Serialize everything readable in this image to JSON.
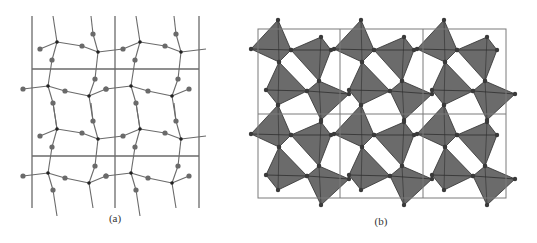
{
  "figure": {
    "panels": [
      {
        "id": "a",
        "caption": "(a)",
        "description": "Framework of linked nodes (T atoms) with bridging atoms, drawn over a 2x2 unit-cell grid",
        "grid": {
          "x_lines": [
            32,
            115,
            199
          ],
          "y_lines": [
            69,
            156
          ],
          "top": 16,
          "bottom": 208
        },
        "cell": {
          "origin": [
            0,
            0
          ],
          "dx": 83,
          "dy": 87,
          "repeat_x": 2,
          "repeat_y": 2
        },
        "nodes": [
          [
            57,
            42
          ],
          [
            98,
            52
          ],
          [
            48,
            86
          ],
          [
            89,
            96
          ]
        ],
        "bridges": [
          [
            40,
            49
          ],
          [
            82,
            46
          ],
          [
            52,
            60
          ],
          [
            93,
            34
          ],
          [
            95,
            79
          ],
          [
            65,
            91
          ],
          [
            23,
            89
          ],
          [
            53,
            103
          ],
          [
            106,
            89
          ]
        ],
        "bonds": [
          [
            [
              40,
              49
            ],
            [
              57,
              42
            ]
          ],
          [
            [
              57,
              42
            ],
            [
              82,
              46
            ]
          ],
          [
            [
              82,
              46
            ],
            [
              98,
              52
            ]
          ],
          [
            [
              57,
              42
            ],
            [
              52,
              60
            ]
          ],
          [
            [
              52,
              60
            ],
            [
              48,
              86
            ]
          ],
          [
            [
              57,
              42
            ],
            [
              53,
              16
            ]
          ],
          [
            [
              98,
              52
            ],
            [
              93,
              34
            ]
          ],
          [
            [
              93,
              34
            ],
            [
              91,
              16
            ]
          ],
          [
            [
              98,
              52
            ],
            [
              123,
              49
            ]
          ],
          [
            [
              98,
              52
            ],
            [
              95,
              79
            ]
          ],
          [
            [
              95,
              79
            ],
            [
              89,
              96
            ]
          ],
          [
            [
              23,
              89
            ],
            [
              48,
              86
            ]
          ],
          [
            [
              48,
              86
            ],
            [
              65,
              91
            ]
          ],
          [
            [
              65,
              91
            ],
            [
              89,
              96
            ]
          ],
          [
            [
              48,
              86
            ],
            [
              53,
              103
            ]
          ],
          [
            [
              53,
              103
            ],
            [
              57,
              129
            ]
          ],
          [
            [
              89,
              96
            ],
            [
              106,
              89
            ]
          ],
          [
            [
              89,
              96
            ],
            [
              93,
              121
            ]
          ]
        ],
        "colors": {
          "line": "#6a6a6a",
          "node": "#222222",
          "bridge": "#6a6a6a"
        }
      },
      {
        "id": "b",
        "caption": "(b)",
        "description": "Polyhedral representation: corner-sharing tetrahedra in a 3x2 unit-cell grid",
        "box": {
          "x": 258,
          "y": 29,
          "width": 248,
          "height": 169
        },
        "dividers": {
          "x": [
            340,
            423
          ],
          "y": [
            114
          ]
        },
        "cell": {
          "origin": [
            258,
            29
          ],
          "dx": 83,
          "dy": 85,
          "repeat_x": 3,
          "repeat_y": 2
        },
        "tetrahedra": [
          [
            [
              20,
              -9
            ],
            [
              -7,
              20
            ],
            [
              21,
              33
            ],
            [
              33,
              21
            ]
          ],
          [
            [
              63,
              8
            ],
            [
              33,
              21
            ],
            [
              61,
              52
            ],
            [
              73,
              21
            ]
          ],
          [
            [
              21,
              33
            ],
            [
              8,
              61
            ],
            [
              20,
              76
            ],
            [
              49,
              62
            ]
          ],
          [
            [
              61,
              52
            ],
            [
              49,
              62
            ],
            [
              63,
              91
            ],
            [
              91,
              65
            ]
          ]
        ],
        "colors": {
          "fill": "#6b6b6b",
          "edge": "#2e2e2e",
          "box": "#7a7a7a",
          "vertex": "#3a3a3a"
        }
      }
    ]
  }
}
